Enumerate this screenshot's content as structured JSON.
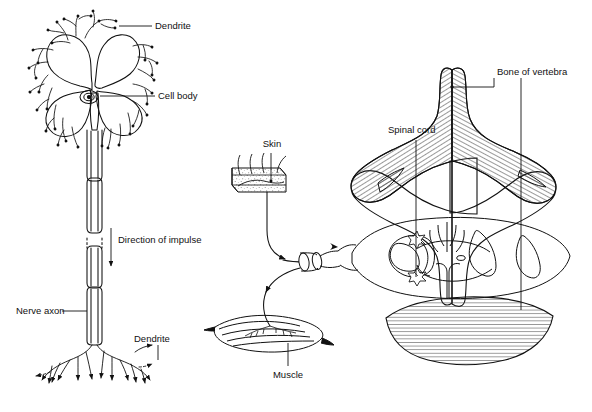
{
  "figure": {
    "background_color": "#ffffff",
    "line_color": "#111111",
    "hatch_color": "#333333",
    "width": 592,
    "height": 412
  },
  "labels": {
    "dendrite_top": "Dendrite",
    "cell_body": "Cell body",
    "direction_of_impulse": "Direction of impulse",
    "nerve_axon": "Nerve axon",
    "dendrite_bottom": "Dendrite",
    "skin": "Skin",
    "muscle": "Muscle",
    "spinal_cord": "Spinal cord",
    "bone_of_vertebra": "Bone of vertebra"
  },
  "panels": {
    "left": {
      "name": "motor-neuron-diagram",
      "parts": [
        "Dendrite",
        "Cell body",
        "Nerve axon",
        "Direction of impulse",
        "Dendrite"
      ]
    },
    "right": {
      "name": "reflex-arc-diagram",
      "parts": [
        "Skin",
        "Muscle",
        "Spinal cord",
        "Bone of vertebra"
      ]
    }
  }
}
